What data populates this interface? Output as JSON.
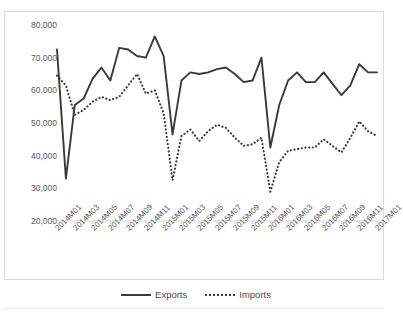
{
  "chart_title": "",
  "legend": {
    "position": "bottom",
    "entries": [
      {
        "label": "Exports",
        "style": "solid",
        "color": "#3a3a3a"
      },
      {
        "label": "Imports",
        "style": "dotted",
        "color": "#3a3a3a"
      }
    ]
  },
  "chart_data": {
    "type": "line",
    "title": "",
    "subtitle": "",
    "xlabel": "",
    "ylabel": "",
    "grid": false,
    "legend_position": "bottom",
    "ylim": [
      20000,
      80000
    ],
    "ytick_labels": [
      "20,000",
      "30,000",
      "40,000",
      "50,000",
      "60,000",
      "70,000",
      "80,000"
    ],
    "ytick_values": [
      20000,
      30000,
      40000,
      50000,
      60000,
      70000,
      80000
    ],
    "xtick_labels": [
      "2014M01",
      "2014M03",
      "2014M05",
      "2014M07",
      "2014M09",
      "2014M11",
      "2015M01",
      "2015M03",
      "2015M05",
      "2015M07",
      "2015M09",
      "2015M11",
      "2016M01",
      "2016M03",
      "2016M05",
      "2016M07",
      "2016M09",
      "2016M11",
      "2017M01"
    ],
    "x": [
      "2014M01",
      "2014M02",
      "2014M03",
      "2014M04",
      "2014M05",
      "2014M06",
      "2014M07",
      "2014M08",
      "2014M09",
      "2014M10",
      "2014M11",
      "2014M12",
      "2015M01",
      "2015M02",
      "2015M03",
      "2015M04",
      "2015M05",
      "2015M06",
      "2015M07",
      "2015M08",
      "2015M09",
      "2015M10",
      "2015M11",
      "2015M12",
      "2016M01",
      "2016M02",
      "2016M03",
      "2016M04",
      "2016M05",
      "2016M06",
      "2016M07",
      "2016M08",
      "2016M09",
      "2016M10",
      "2016M11",
      "2016M12",
      "2017M01"
    ],
    "series": [
      {
        "name": "Exports",
        "style": "solid",
        "color": "#3a3a3a",
        "values": [
          72500,
          33000,
          55500,
          57500,
          63500,
          67000,
          63000,
          73000,
          72500,
          70500,
          70000,
          76500,
          70500,
          46500,
          63000,
          65500,
          65000,
          65500,
          66500,
          67000,
          65000,
          62500,
          63000,
          70000,
          42500,
          55500,
          63000,
          65500,
          62500,
          62500,
          65500,
          62000,
          58500,
          61500,
          68000,
          65500,
          65500
        ]
      },
      {
        "name": "Imports",
        "style": "dotted",
        "color": "#3a3a3a",
        "values": [
          64500,
          61500,
          52500,
          54000,
          56500,
          58000,
          57000,
          58000,
          61500,
          65000,
          59000,
          60000,
          53000,
          32500,
          46000,
          48000,
          44500,
          47500,
          49500,
          48500,
          45500,
          43000,
          43500,
          45500,
          29000,
          38000,
          41500,
          42000,
          42500,
          42500,
          45000,
          43000,
          41000,
          45500,
          50500,
          47500,
          46000
        ]
      }
    ]
  }
}
